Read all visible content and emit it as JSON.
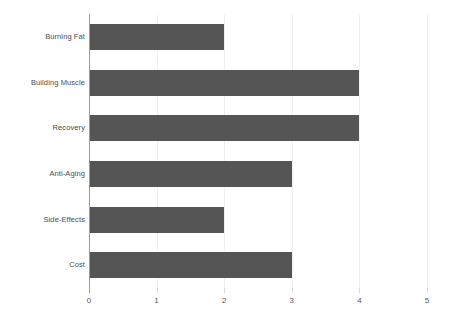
{
  "chart_data": {
    "type": "bar",
    "orientation": "horizontal",
    "title": "",
    "subtitle": "",
    "xlabel": "",
    "ylabel": "",
    "categories": [
      "Burning Fat",
      "Building Muscle",
      "Recovery",
      "Anti-Aging",
      "Side-Effects",
      "Cost"
    ],
    "values": [
      2,
      4,
      4,
      3,
      2,
      3
    ],
    "xlim": [
      0,
      5
    ],
    "xticks": [
      0,
      1,
      2,
      3,
      4,
      5
    ],
    "xtick_labels": [
      "0",
      "1",
      "2",
      "3",
      "4",
      "5"
    ],
    "grid": true,
    "grid_axis": "x",
    "legend": false,
    "legend_position": "none",
    "bar_color": "#555555",
    "axis_color": "#9a9a9a",
    "gridline_color": "#f0f0f0",
    "label_color": "#4c4c4c",
    "tick_label_color": "#555555",
    "background_color": "#ffffff"
  }
}
